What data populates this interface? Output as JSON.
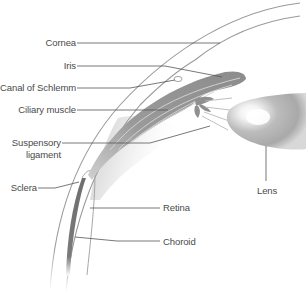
{
  "diagram": {
    "type": "anatomical cross-section",
    "labels": {
      "cornea": "Cornea",
      "iris": "Iris",
      "canal_of_schlemm": "Canal of Schlemm",
      "ciliary_muscle": "Ciliary muscle",
      "suspensory_ligament_line1": "Suspensory",
      "suspensory_ligament_line2": "ligament",
      "sclera": "Sclera",
      "lens": "Lens",
      "retina": "Retina",
      "choroid": "Choroid"
    },
    "colors": {
      "background": "#ffffff",
      "label_text": "#4a4a4a",
      "leader_line": "#555555",
      "outline": "#9a9a9a",
      "tissue_dark": "#8a8a8a",
      "tissue_mid": "#b5b5b5",
      "highlight": "#f5f5f5"
    }
  }
}
